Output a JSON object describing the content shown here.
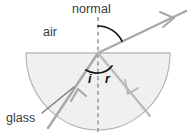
{
  "figure": {
    "type": "optics-refraction-diagram",
    "title_text": "",
    "background_color": "#ffffff"
  },
  "labels": {
    "normal": "normal",
    "air": "air",
    "glass": "glass",
    "angle_incidence": "i",
    "angle_refraction": "r"
  },
  "colors": {
    "glass_fill": "#f0f0f0",
    "glass_outline": "#b4b4b4",
    "ray": "#a8a8a8",
    "normal_line": "#9a9a9a",
    "angle_arc": "#111111",
    "leader_line": "#7d7d7d",
    "text": "#3a3a3a"
  },
  "geometry": {
    "block_shape": "semicircle",
    "flat_edge_y": 53,
    "flat_edge_x_start": 26,
    "flat_edge_x_end": 170,
    "center_point": [
      98,
      53
    ],
    "radius": 72,
    "normal_line_x": 98,
    "normal_line_y_top": 17,
    "normal_line_y_bottom": 133,
    "incident_ray_start": [
      48,
      128
    ],
    "incident_ray_end": [
      98,
      53
    ],
    "emergent_ray_start": [
      98,
      53
    ],
    "emergent_ray_end": [
      186,
      11
    ],
    "internal_ray_start": [
      98,
      53
    ],
    "internal_ray_end": [
      150,
      116
    ],
    "leader_line_start": [
      42,
      112
    ],
    "leader_line_end": [
      72,
      88
    ]
  }
}
